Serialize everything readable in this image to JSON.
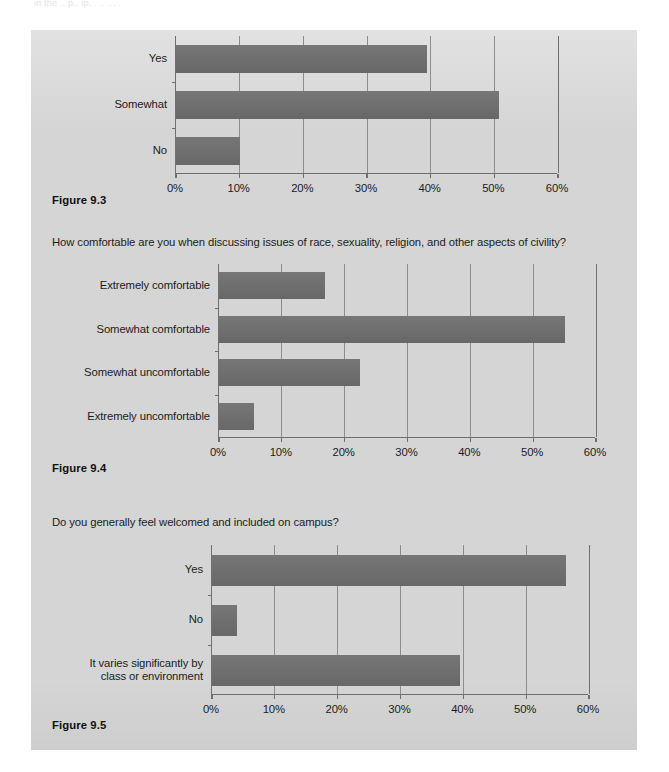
{
  "page": {
    "clipped_top_text": "in the  .. p.. ip. .  ..  ...  .",
    "background_color": "#d5d5d5",
    "bar_color": "#6e6e6e",
    "axis_color": "#6f6f6f"
  },
  "figures": [
    {
      "id": "figure-9-3",
      "caption": "Figure 9.3",
      "question": "",
      "chart_data": {
        "type": "bar",
        "orientation": "horizontal",
        "title": "",
        "xlabel": "",
        "ylabel": "",
        "categories": [
          "Yes",
          "Somewhat",
          "No"
        ],
        "values": [
          39.5,
          50.7,
          10.0
        ],
        "xlim": [
          0,
          60
        ],
        "xticks": [
          0,
          10,
          20,
          30,
          40,
          50,
          60
        ],
        "xtick_labels": [
          "0%",
          "10%",
          "20%",
          "30%",
          "40%",
          "50%",
          "60%"
        ],
        "grid": true,
        "legend": false
      }
    },
    {
      "id": "figure-9-4",
      "caption": "Figure 9.4",
      "question": "How comfortable are you when discussing issues of race, sexuality, religion, and other aspects of civility?",
      "chart_data": {
        "type": "bar",
        "orientation": "horizontal",
        "title": "How comfortable are you when discussing issues of race, sexuality, religion, and other aspects of civility?",
        "xlabel": "",
        "ylabel": "",
        "categories": [
          "Extremely comfortable",
          "Somewhat comfortable",
          "Somewhat uncomfortable",
          "Extremely uncomfortable"
        ],
        "values": [
          16.8,
          55.0,
          22.5,
          5.5
        ],
        "xlim": [
          0,
          60
        ],
        "xticks": [
          0,
          10,
          20,
          30,
          40,
          50,
          60
        ],
        "xtick_labels": [
          "0%",
          "10%",
          "20%",
          "30%",
          "40%",
          "50%",
          "60%"
        ],
        "grid": true,
        "legend": false
      }
    },
    {
      "id": "figure-9-5",
      "caption": "Figure 9.5",
      "question": "Do you generally feel welcomed and included on campus?",
      "chart_data": {
        "type": "bar",
        "orientation": "horizontal",
        "title": "Do you generally feel welcomed and included on campus?",
        "xlabel": "",
        "ylabel": "",
        "categories": [
          "Yes",
          "No",
          "It varies significantly by\nclass or environment"
        ],
        "values": [
          56.3,
          4.0,
          39.5
        ],
        "xlim": [
          0,
          60
        ],
        "xticks": [
          0,
          10,
          20,
          30,
          40,
          50,
          60
        ],
        "xtick_labels": [
          "0%",
          "10%",
          "20%",
          "30%",
          "40%",
          "50%",
          "60%"
        ],
        "grid": true,
        "legend": false
      }
    }
  ]
}
